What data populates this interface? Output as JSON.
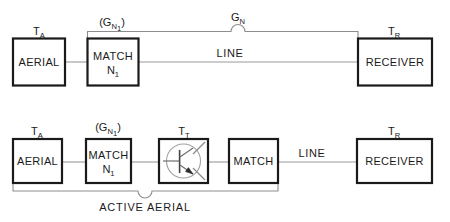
{
  "top_diagram": {
    "name": "passive-aerial-chain",
    "blocks": [
      {
        "id": "aerial",
        "label": "AERIAL",
        "label2": "",
        "terminal_label": "T",
        "terminal_sub": "A"
      },
      {
        "id": "match",
        "label": "MATCH",
        "label2": "N",
        "label2_sub": "1",
        "gain_label": "(G",
        "gain_sub": "N",
        "gain_sub2": "1",
        "gain_close": ")"
      },
      {
        "id": "receiver",
        "label": "RECEIVER",
        "label2": "",
        "terminal_label": "T",
        "terminal_sub": "R"
      }
    ],
    "wire_label": "LINE",
    "bracket_label": "G",
    "bracket_label_sub": "N"
  },
  "bottom_diagram": {
    "name": "active-aerial-chain",
    "blocks": [
      {
        "id": "aerial",
        "label": "AERIAL",
        "terminal_label": "T",
        "terminal_sub": "A"
      },
      {
        "id": "match1",
        "label": "MATCH",
        "label2": "N",
        "label2_sub": "1",
        "gain_label": "(G",
        "gain_sub": "N",
        "gain_sub2": "1",
        "gain_close": ")"
      },
      {
        "id": "transistor",
        "label": "",
        "terminal_label": "T",
        "terminal_sub": "T",
        "symbol": "transistor-symbol"
      },
      {
        "id": "match2",
        "label": "MATCH"
      },
      {
        "id": "receiver",
        "label": "RECEIVER",
        "terminal_label": "T",
        "terminal_sub": "R"
      }
    ],
    "wire_label": "LINE",
    "bracket_label": "ACTIVE AERIAL"
  },
  "colors": {
    "box_stroke": "#1a1a1a",
    "wire": "#9a9a9a",
    "bracket": "#8d8d8d",
    "text": "#1a1a1a",
    "background": "#ffffff"
  }
}
